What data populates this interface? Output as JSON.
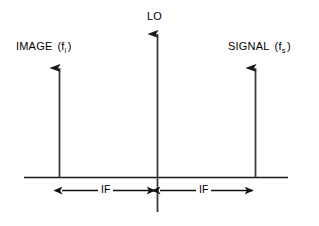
{
  "diagram": {
    "stroke_color": "#1a1a1a",
    "background_color": "#ffffff",
    "axis": {
      "baseline_label": "frequency-axis"
    },
    "spectral_lines": [
      {
        "id": "image",
        "label_text": "IMAGE",
        "symbol_base": "f",
        "symbol_sub": "i",
        "open_paren": "(",
        "close_paren": ")",
        "x": 59,
        "top_y": 61,
        "bottom_y": 177
      },
      {
        "id": "lo",
        "label_text": "LO",
        "symbol_base": "",
        "symbol_sub": "",
        "open_paren": "",
        "close_paren": "",
        "x": 157,
        "top_y": 27,
        "bottom_y": 212
      },
      {
        "id": "signal",
        "label_text": "SIGNAL",
        "symbol_base": "f",
        "symbol_sub": "s",
        "open_paren": "(",
        "close_paren": ")",
        "x": 255,
        "top_y": 61,
        "bottom_y": 177
      }
    ],
    "measurements": [
      {
        "id": "if-left",
        "label": "IF",
        "from_x": 59,
        "to_x": 157,
        "y": 190
      },
      {
        "id": "if-right",
        "label": "IF",
        "from_x": 157,
        "to_x": 255,
        "y": 190
      }
    ]
  }
}
